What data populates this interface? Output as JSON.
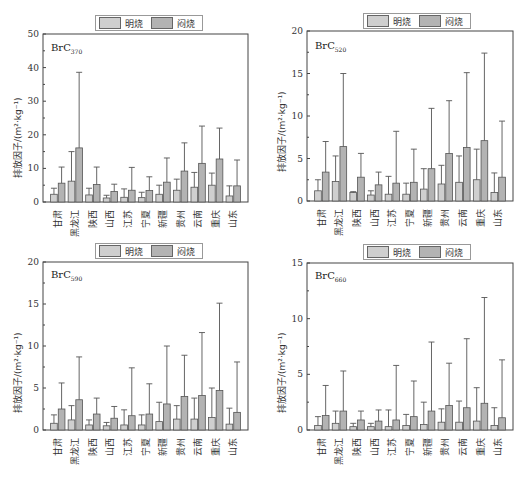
{
  "legend": {
    "items": [
      {
        "label": "明烧",
        "color": "#cfcfcf"
      },
      {
        "label": "闷烧",
        "color": "#b3b3b3"
      }
    ]
  },
  "ylabel": "排放因子/(m²·kg⁻¹)",
  "chart_data": [
    {
      "type": "bar",
      "title": "BrC",
      "subscript": "370",
      "xlabel": "",
      "ylabel": "排放因子/(m²·kg⁻¹)",
      "ylim": [
        0,
        50
      ],
      "yticks": [
        0,
        10,
        20,
        30,
        40,
        50
      ],
      "categories": [
        "甘肃",
        "黑龙江",
        "陕西",
        "山西",
        "江苏",
        "宁夏",
        "新疆",
        "贵州",
        "云南",
        "重庆",
        "山东"
      ],
      "series": [
        {
          "name": "明烧",
          "values": [
            2.3,
            6.2,
            2.1,
            1.2,
            1.4,
            1.3,
            2.3,
            3.5,
            4.4,
            5.0,
            1.8
          ],
          "err_top": [
            4.1,
            15.0,
            4.1,
            2.0,
            3.9,
            2.9,
            5.0,
            6.8,
            8.8,
            8.6,
            4.8
          ]
        },
        {
          "name": "闷烧",
          "values": [
            5.6,
            16.1,
            5.2,
            3.1,
            3.5,
            3.4,
            5.9,
            9.2,
            11.5,
            12.8,
            4.8
          ],
          "err_top": [
            10.4,
            38.6,
            10.4,
            5.3,
            10.3,
            7.5,
            13.1,
            17.6,
            22.6,
            22.0,
            12.5
          ]
        }
      ],
      "legend_position": "top",
      "grid": false
    },
    {
      "type": "bar",
      "title": "BrC",
      "subscript": "520",
      "xlabel": "",
      "ylabel": "排放因子/(m²·kg⁻¹)",
      "ylim": [
        0,
        20
      ],
      "yticks": [
        0,
        5,
        10,
        15,
        20
      ],
      "categories": [
        "甘肃",
        "黑龙江",
        "陕西",
        "山西",
        "江苏",
        "宁夏",
        "新疆",
        "贵州",
        "云南",
        "重庆",
        "山东"
      ],
      "series": [
        {
          "name": "明烧",
          "values": [
            1.2,
            2.3,
            1.0,
            0.7,
            0.8,
            0.8,
            1.4,
            2.0,
            2.2,
            2.5,
            1.0
          ],
          "err_top": [
            2.5,
            5.3,
            1.1,
            1.2,
            2.9,
            2.1,
            3.8,
            4.2,
            5.3,
            6.1,
            3.3
          ]
        },
        {
          "name": "闷烧",
          "values": [
            3.4,
            6.4,
            2.8,
            1.9,
            2.1,
            2.2,
            3.8,
            5.6,
            6.3,
            7.1,
            2.8
          ],
          "err_top": [
            7.0,
            15.0,
            5.6,
            3.4,
            8.2,
            6.1,
            10.9,
            11.8,
            15.1,
            17.4,
            9.4
          ]
        }
      ],
      "legend_position": "top",
      "grid": false
    },
    {
      "type": "bar",
      "title": "BrC",
      "subscript": "590",
      "xlabel": "",
      "ylabel": "排放因子/(m²·kg⁻¹)",
      "ylim": [
        0,
        20
      ],
      "yticks": [
        0,
        5,
        10,
        15,
        20
      ],
      "categories": [
        "甘肃",
        "黑龙江",
        "陕西",
        "山西",
        "江苏",
        "宁夏",
        "新疆",
        "贵州",
        "云南",
        "重庆",
        "山东"
      ],
      "series": [
        {
          "name": "明烧",
          "values": [
            0.8,
            1.2,
            0.6,
            0.5,
            0.6,
            0.6,
            1.0,
            1.3,
            1.3,
            1.5,
            0.7
          ],
          "err_top": [
            1.8,
            2.9,
            1.2,
            0.9,
            2.4,
            1.8,
            3.3,
            2.9,
            3.8,
            5.0,
            2.6
          ]
        },
        {
          "name": "闷烧",
          "values": [
            2.5,
            3.6,
            1.9,
            1.4,
            1.7,
            1.9,
            3.1,
            4.0,
            4.1,
            4.7,
            2.1
          ],
          "err_top": [
            5.6,
            8.7,
            3.8,
            2.8,
            7.4,
            5.5,
            10.0,
            8.9,
            11.6,
            15.1,
            8.1
          ]
        }
      ],
      "legend_position": "top",
      "grid": false
    },
    {
      "type": "bar",
      "title": "BrC",
      "subscript": "660",
      "xlabel": "",
      "ylabel": "排放因子/(m²·kg⁻¹)",
      "ylim": [
        0,
        15
      ],
      "yticks": [
        0,
        5,
        10,
        15
      ],
      "categories": [
        "甘肃",
        "黑龙江",
        "陕西",
        "山西",
        "江苏",
        "宁夏",
        "新疆",
        "贵州",
        "云南",
        "重庆",
        "山东"
      ],
      "series": [
        {
          "name": "明烧",
          "values": [
            0.4,
            0.6,
            0.3,
            0.3,
            0.3,
            0.4,
            0.5,
            0.7,
            0.7,
            0.8,
            0.4
          ],
          "err_top": [
            1.2,
            1.7,
            0.6,
            0.6,
            1.8,
            1.4,
            2.5,
            1.9,
            2.6,
            3.8,
            2.0
          ]
        },
        {
          "name": "闷烧",
          "values": [
            1.3,
            1.7,
            0.9,
            0.8,
            0.9,
            1.2,
            1.7,
            2.2,
            2.0,
            2.4,
            1.1
          ],
          "err_top": [
            4.0,
            5.3,
            1.7,
            1.8,
            5.8,
            4.4,
            7.9,
            6.0,
            8.2,
            11.9,
            6.3
          ]
        }
      ],
      "legend_position": "top",
      "grid": false
    }
  ]
}
